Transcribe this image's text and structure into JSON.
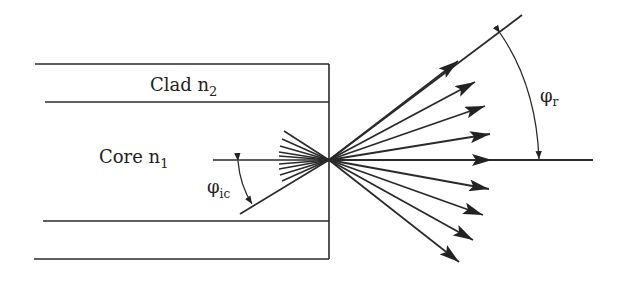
{
  "diagram": {
    "labels": {
      "clad": "Clad n",
      "clad_sub": "2",
      "core": "Core n",
      "core_sub": "1",
      "phi_ic": "φ",
      "phi_ic_sub": "ic",
      "phi_r": "φ",
      "phi_r_sub": "r"
    },
    "colors": {
      "line": "#2a2a2a",
      "background": "#ffffff"
    }
  }
}
